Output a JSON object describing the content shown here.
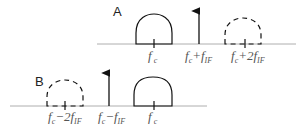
{
  "colors": {
    "baseline": "#9a9a9a",
    "shape": "#111111",
    "label": "#555555",
    "panel_label": "#222222"
  },
  "panel_a": {
    "label": "A",
    "freq_labels": [
      {
        "main": "f",
        "sub1": "c",
        "op": "",
        "coef": "",
        "sub2": "",
        "x": 154
      },
      {
        "main": "f",
        "sub1": "c",
        "op": "+",
        "coef": "",
        "sub2": "IF",
        "x": 199
      },
      {
        "main": "f",
        "sub1": "c",
        "op": "+2",
        "coef": "",
        "sub2": "IF",
        "x": 249
      }
    ],
    "elements": [
      {
        "type": "solid-arch",
        "center": "f_c"
      },
      {
        "type": "arrow",
        "at": "f_c+f_IF"
      },
      {
        "type": "dashed-arch",
        "center": "f_c+2f_IF"
      }
    ]
  },
  "panel_b": {
    "label": "B",
    "freq_labels": [
      {
        "main": "f",
        "sub1": "c",
        "op": "−2",
        "sub2": "IF",
        "x": 65
      },
      {
        "main": "f",
        "sub1": "c",
        "op": "−",
        "sub2": "IF",
        "x": 112
      },
      {
        "main": "f",
        "sub1": "c",
        "op": "",
        "sub2": "",
        "x": 154
      }
    ],
    "elements": [
      {
        "type": "dashed-arch",
        "center": "f_c-2f_IF"
      },
      {
        "type": "arrow",
        "at": "f_c-f_IF"
      },
      {
        "type": "solid-arch",
        "center": "f_c"
      }
    ]
  },
  "text": {
    "a_fc_main": "f",
    "a_fc_sub": "c",
    "a_sum1_main": "f",
    "a_sum1_sub": "c",
    "a_sum1_op": "+f",
    "a_sum1_sub2": "IF",
    "a_sum2_main": "f",
    "a_sum2_sub": "c",
    "a_sum2_op": "+2f",
    "a_sum2_sub2": "IF",
    "b_diff2_main": "f",
    "b_diff2_sub": "c",
    "b_diff2_op": "−2f",
    "b_diff2_sub2": "IF",
    "b_diff1_main": "f",
    "b_diff1_sub": "c",
    "b_diff1_op": "−f",
    "b_diff1_sub2": "IF",
    "b_fc_main": "f",
    "b_fc_sub": "c"
  }
}
